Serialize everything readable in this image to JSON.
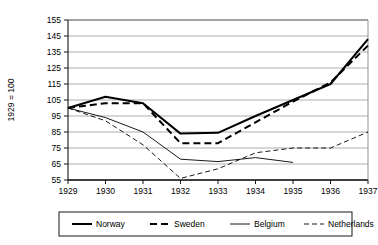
{
  "chart_data": {
    "type": "line",
    "title": "",
    "subtitle": "",
    "xlabel": "",
    "ylabel": "1929 = 100",
    "x": [
      1929,
      1930,
      1931,
      1932,
      1933,
      1934,
      1935,
      1936,
      1937
    ],
    "xticklabels": [
      "1929",
      "1930",
      "1931",
      "1932",
      "1933",
      "1934",
      "1935",
      "1936",
      "1937"
    ],
    "yticklabels": [
      "55",
      "65",
      "75",
      "85",
      "95",
      "105",
      "115",
      "125",
      "135",
      "145",
      "155"
    ],
    "yticks": [
      55,
      65,
      75,
      85,
      95,
      105,
      115,
      125,
      135,
      145,
      155
    ],
    "ylim": [
      55,
      155
    ],
    "xlim": [
      1929,
      1937
    ],
    "grid": "horizontal",
    "legend_position": "bottom",
    "series": [
      {
        "name": "Norway",
        "style": "solid-thick",
        "color": "#000000",
        "values": [
          100,
          107,
          103,
          84,
          84.5,
          95,
          105,
          115,
          143
        ]
      },
      {
        "name": "Sweden",
        "style": "dashed-thick",
        "color": "#000000",
        "values": [
          100,
          103,
          103,
          78,
          78,
          91,
          104,
          116,
          139
        ]
      },
      {
        "name": "Belgium",
        "style": "solid-thin",
        "color": "#000000",
        "values": [
          100,
          94,
          85,
          68,
          66.5,
          69,
          66,
          null,
          null
        ]
      },
      {
        "name": "Netherlands",
        "style": "dashed-thin",
        "color": "#000000",
        "values": [
          100,
          92,
          77,
          56,
          62,
          72,
          75,
          75,
          85
        ]
      }
    ]
  },
  "legend": {
    "items": [
      {
        "label": "Norway"
      },
      {
        "label": "Sweden"
      },
      {
        "label": "Belgium"
      },
      {
        "label": "Netherlands"
      }
    ]
  },
  "axis": {
    "y_title": "1929 = 100"
  }
}
